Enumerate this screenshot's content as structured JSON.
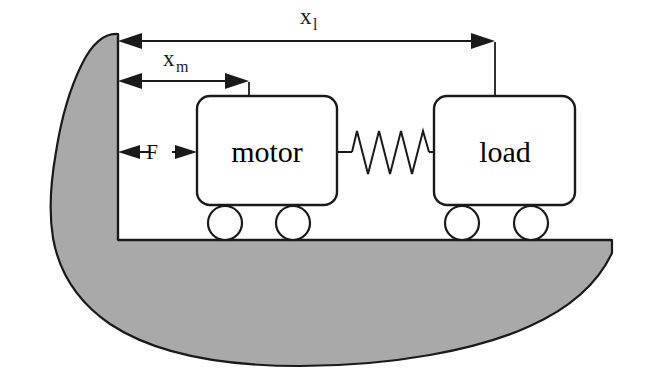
{
  "figure": {
    "background_color": "#ffffff",
    "stroke_color": "#1a1a1a",
    "hull_fill_color": "#a9a9a9",
    "body_fill_color": "#ffffff"
  },
  "bodies": [
    {
      "id": "motor",
      "label": "motor",
      "wheel_count": 2
    },
    {
      "id": "load",
      "label": "load",
      "wheel_count": 2
    }
  ],
  "connector": {
    "name": "spring",
    "coils": 6
  },
  "dimensions": [
    {
      "id": "x-load",
      "base": "x",
      "subscript": "l",
      "from": "hull-wall",
      "to": "load-reference-line"
    },
    {
      "id": "x-motor",
      "base": "x",
      "subscript": "m",
      "from": "hull-wall",
      "to": "motor-reference-line"
    }
  ],
  "force": {
    "id": "force-F",
    "label": "F",
    "direction": "bidirectional-horizontal",
    "from": "hull-wall",
    "to": "motor-body"
  },
  "ground": {
    "name": "hull-deck-line"
  }
}
